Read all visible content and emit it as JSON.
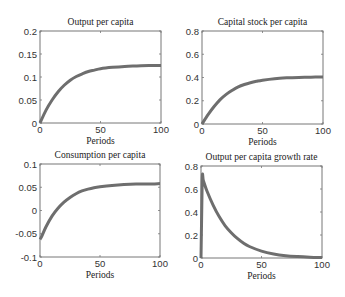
{
  "figure": {
    "background": "#ffffff",
    "axes_color": "#777777",
    "line_color": "#6e6e6e"
  },
  "chart_data": [
    {
      "type": "line",
      "title": "Output per capita",
      "xlabel": "Periods",
      "ylabel": "",
      "xlim": [
        0,
        100
      ],
      "ylim": [
        0,
        0.2
      ],
      "xticks": [
        0,
        50,
        100
      ],
      "xtick_labels": [
        "0",
        "50",
        "100"
      ],
      "yticks": [
        0,
        0.05,
        0.1,
        0.15,
        0.2
      ],
      "ytick_labels": [
        "0",
        "0.05",
        "0.1",
        "0.15",
        "0.2"
      ],
      "grid": false,
      "box": {
        "left": 40,
        "top": 31,
        "right": 161,
        "bottom": 123
      },
      "x": [
        0,
        5,
        10,
        15,
        20,
        25,
        30,
        35,
        40,
        45,
        50,
        60,
        70,
        80,
        90,
        100
      ],
      "values": [
        0,
        0.028,
        0.05,
        0.068,
        0.082,
        0.093,
        0.101,
        0.107,
        0.112,
        0.115,
        0.118,
        0.121,
        0.123,
        0.124,
        0.125,
        0.125
      ]
    },
    {
      "type": "line",
      "title": "Capital stock per capita",
      "xlabel": "Periods",
      "ylabel": "",
      "xlim": [
        0,
        100
      ],
      "ylim": [
        0,
        0.8
      ],
      "xticks": [
        0,
        50,
        100
      ],
      "xtick_labels": [
        "0",
        "50",
        "100"
      ],
      "yticks": [
        0,
        0.2,
        0.4,
        0.6,
        0.8
      ],
      "ytick_labels": [
        "0",
        "0.2",
        "0.4",
        "0.6",
        "0.8"
      ],
      "grid": false,
      "box": {
        "left": 202,
        "top": 31,
        "right": 323,
        "bottom": 124
      },
      "x": [
        0,
        5,
        10,
        15,
        20,
        25,
        30,
        35,
        40,
        45,
        50,
        60,
        70,
        80,
        90,
        100
      ],
      "values": [
        0,
        0.08,
        0.15,
        0.21,
        0.255,
        0.29,
        0.32,
        0.34,
        0.355,
        0.367,
        0.377,
        0.39,
        0.397,
        0.401,
        0.403,
        0.404
      ]
    },
    {
      "type": "line",
      "title": "Consumption per capita",
      "xlabel": "Periods",
      "ylabel": "",
      "xlim": [
        0,
        100
      ],
      "ylim": [
        -0.1,
        0.1
      ],
      "xticks": [
        0,
        50,
        100
      ],
      "xtick_labels": [
        "0",
        "50",
        "100"
      ],
      "yticks": [
        -0.1,
        -0.05,
        0,
        0.05,
        0.1
      ],
      "ytick_labels": [
        "-0.1",
        "-0.05",
        "0",
        "0.05",
        "0.1"
      ],
      "grid": false,
      "box": {
        "left": 40,
        "top": 164,
        "right": 160,
        "bottom": 257
      },
      "x": [
        0,
        1,
        5,
        10,
        15,
        20,
        25,
        30,
        35,
        40,
        45,
        50,
        60,
        70,
        80,
        90,
        100
      ],
      "values": [
        -0.062,
        -0.058,
        -0.035,
        -0.012,
        0.005,
        0.018,
        0.028,
        0.036,
        0.042,
        0.046,
        0.049,
        0.051,
        0.054,
        0.056,
        0.057,
        0.057,
        0.058
      ]
    },
    {
      "type": "line",
      "title": "Output per capita growth rate",
      "xlabel": "Periods",
      "ylabel": "",
      "xlim": [
        0,
        100
      ],
      "ylim": [
        0,
        0.8
      ],
      "xticks": [
        0,
        50,
        100
      ],
      "xtick_labels": [
        "0",
        "50",
        "100"
      ],
      "yticks": [
        0,
        0.2,
        0.4,
        0.6,
        0.8
      ],
      "ytick_labels": [
        "0",
        "0.2",
        "0.4",
        "0.6",
        "0.8"
      ],
      "grid": false,
      "box": {
        "left": 201,
        "top": 166,
        "right": 322,
        "bottom": 258
      },
      "x": [
        0,
        1,
        2,
        5,
        10,
        15,
        20,
        25,
        30,
        35,
        40,
        50,
        60,
        70,
        80,
        90,
        100
      ],
      "values": [
        0,
        0.68,
        0.67,
        0.58,
        0.46,
        0.36,
        0.28,
        0.22,
        0.17,
        0.13,
        0.1,
        0.06,
        0.035,
        0.02,
        0.012,
        0.007,
        0.004
      ]
    }
  ]
}
